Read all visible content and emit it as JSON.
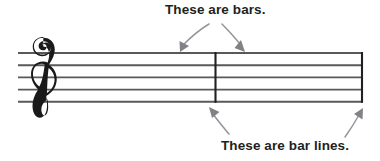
{
  "figure": {
    "background_color": "#ffffff"
  },
  "annotations": {
    "top": {
      "text": "These are bars.",
      "color": "#231f20",
      "points_to": [
        "bar-1",
        "bar-2"
      ]
    },
    "bottom": {
      "text": "These are bar lines.",
      "color": "#231f20",
      "points_to": [
        "bar-line-middle",
        "bar-line-end"
      ]
    },
    "arrow_color": "#939598"
  },
  "stave": {
    "clef": "treble-clef",
    "line_color": "#58595b",
    "bar_line_color": "#231f20",
    "line_count": 5,
    "bar_count": 2,
    "bar_line_count": 2
  }
}
